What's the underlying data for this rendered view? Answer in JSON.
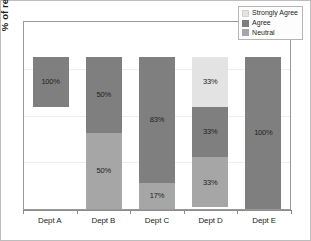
{
  "chart_data": {
    "type": "bar",
    "subtype": "100% stacked bar",
    "title": "",
    "xlabel": "",
    "ylabel": "% of respondents",
    "ylim": [
      0,
      100
    ],
    "grid": true,
    "legend_position": "top-right",
    "categories": [
      "Dept A",
      "Dept B",
      "Dept C",
      "Dept D",
      "Dept E"
    ],
    "series": [
      {
        "name": "Strongly Agree",
        "color": "#e3e3e3",
        "values": [
          0,
          0,
          0,
          33,
          0
        ]
      },
      {
        "name": "Agree",
        "color": "#7f7f7f",
        "values": [
          100,
          50,
          83,
          33,
          100
        ]
      },
      {
        "name": "Neutral",
        "color": "#a6a6a6",
        "values": [
          0,
          50,
          17,
          33,
          0
        ]
      }
    ],
    "stacks": [
      {
        "category": "Dept A",
        "segments": [
          {
            "series": "Agree",
            "value": 33,
            "label": "100%",
            "class": "s-agree"
          }
        ]
      },
      {
        "category": "Dept B",
        "segments": [
          {
            "series": "Agree",
            "value": 50,
            "label": "50%",
            "class": "s-agree"
          },
          {
            "series": "Neutral",
            "value": 50,
            "label": "50%",
            "class": "s-neutral"
          }
        ]
      },
      {
        "category": "Dept C",
        "segments": [
          {
            "series": "Agree",
            "value": 83,
            "label": "83%",
            "class": "s-agree"
          },
          {
            "series": "Neutral",
            "value": 17,
            "label": "17%",
            "class": "s-neutral"
          }
        ]
      },
      {
        "category": "Dept D",
        "segments": [
          {
            "series": "Strongly Agree",
            "value": 33,
            "label": "33%",
            "class": "s-strongly"
          },
          {
            "series": "Agree",
            "value": 33,
            "label": "33%",
            "class": "s-agree"
          },
          {
            "series": "Neutral",
            "value": 33,
            "label": "33%",
            "class": "s-neutral"
          }
        ]
      },
      {
        "category": "Dept E",
        "segments": [
          {
            "series": "Agree",
            "value": 100,
            "label": "100%",
            "class": "s-agree"
          }
        ]
      }
    ]
  },
  "legend": {
    "items": [
      {
        "label": "Strongly Agree",
        "class": "s-strongly"
      },
      {
        "label": "Agree",
        "class": "s-agree"
      },
      {
        "label": "Neutral",
        "class": "s-neutral"
      }
    ]
  },
  "axes": {
    "y_title": "% of respondents",
    "x_labels": [
      "Dept A",
      "Dept B",
      "Dept C",
      "Dept D",
      "Dept E"
    ]
  },
  "colors": {
    "strongly_agree": "#e3e3e3",
    "agree": "#7f7f7f",
    "neutral": "#a6a6a6",
    "plot_border": "#9a9a9a",
    "gridline": "#eeeeee",
    "text": "#231f20"
  }
}
